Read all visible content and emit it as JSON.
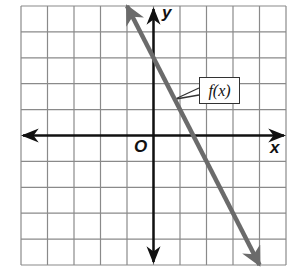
{
  "chart_data": {
    "type": "line",
    "title": "",
    "xlabel": "x",
    "ylabel": "y",
    "origin_label": "O",
    "xlim": [
      -5,
      5
    ],
    "ylim": [
      -5,
      5
    ],
    "grid": true,
    "grid_step": 1,
    "series": [
      {
        "name": "f(x)",
        "equation": "f(x) = -2x + 3",
        "x": [
          -1,
          0,
          1.5,
          4
        ],
        "y": [
          5,
          3,
          0,
          -5
        ],
        "arrows": "both",
        "color": "#6b6b6b"
      }
    ],
    "annotations": [
      {
        "text": "f(x)",
        "points_to": [
          0.8,
          1.4
        ],
        "boxed": true
      }
    ]
  },
  "colors": {
    "grid": "#8a8a8a",
    "axes": "#111111",
    "line": "#6b6b6b"
  }
}
